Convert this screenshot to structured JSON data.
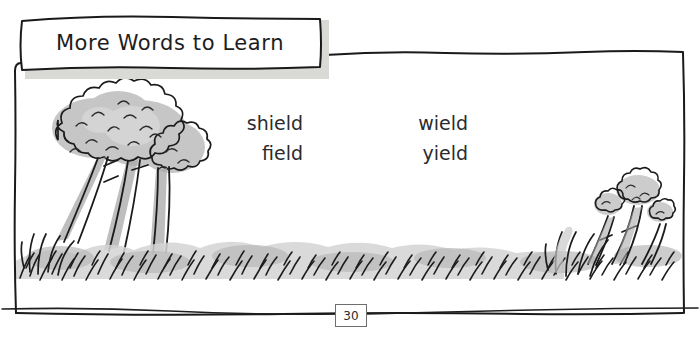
{
  "page": {
    "background_color": "#ffffff",
    "width": 700,
    "height": 337
  },
  "title_box": {
    "label": "More Words to Learn",
    "text_color": "#1d1d1d",
    "box_fill": "#ffffff",
    "shadow_color": "#d9d9d6",
    "border_color": "#1a1a1a"
  },
  "frame": {
    "border_color": "#1a1a1a",
    "style": "hand-drawn-rectangle"
  },
  "word_list": {
    "columns": [
      {
        "words": [
          "shield",
          "field"
        ]
      },
      {
        "words": [
          "wield",
          "yield"
        ]
      }
    ],
    "text_color": "#2b2b2f"
  },
  "illustration": {
    "description": "hand-drawn trees and grass",
    "left_scene": "three leaning trees with bushy canopies",
    "right_scene": "small saplings in grass",
    "ink_color": "#1b1b1b",
    "wash_gray": "#b9b9b9",
    "wash_light": "#d8d8d8"
  },
  "footer": {
    "page_number": "30",
    "rule_color": "#1e1e1e",
    "box_border_color": "#6e6e6e"
  }
}
